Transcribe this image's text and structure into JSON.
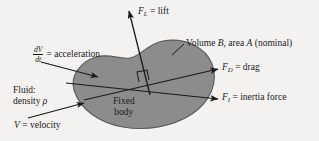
{
  "figure": {
    "type": "free-body / force diagram",
    "background_color": "#f3f2f0",
    "body_fill_color": "#8c8c8c",
    "body_edge_color": "#4d4d4d",
    "line_color": "#1a1a1a"
  },
  "body": {
    "line1": "Fixed",
    "line2": "body"
  },
  "labels": {
    "lift": {
      "symbol": "F",
      "subscript": "L",
      "equals": "=",
      "text": "lift"
    },
    "drag": {
      "symbol": "F",
      "subscript": "D",
      "equals": "=",
      "text": "drag"
    },
    "inertia": {
      "symbol": "F",
      "subscript": "I",
      "equals": "=",
      "text": "inertia force"
    },
    "acceleration": {
      "numerator": "dV",
      "denominator": "dt",
      "equals": "=",
      "text": "acceleration"
    },
    "velocity": {
      "symbol": "V",
      "equals": "=",
      "text": "velocity"
    },
    "fluid": {
      "line1": "Fluid:",
      "line2_prefix": "density ",
      "line2_symbol": "ρ"
    },
    "volume": {
      "prefix": "Volume ",
      "symbol_b": "B",
      "middle": ", area ",
      "symbol_a": "A",
      "suffix": " (nominal)"
    }
  },
  "annotations": {
    "right_angle_marker": "right-angle-square"
  }
}
